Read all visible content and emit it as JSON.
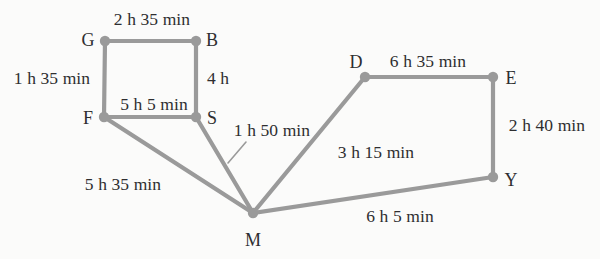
{
  "diagram": {
    "type": "undirected-weighted-graph",
    "title": "",
    "stroke_color": "#9a9a9a",
    "text_color": "#2e2e30",
    "background_color": "#fbfbfa",
    "nodes": [
      {
        "id": "G",
        "label": "G",
        "x": 105,
        "y": 41,
        "label_x": 88,
        "label_y": 40
      },
      {
        "id": "B",
        "label": "B",
        "x": 196,
        "y": 41,
        "label_x": 212,
        "label_y": 40
      },
      {
        "id": "F",
        "label": "F",
        "x": 104,
        "y": 117,
        "label_x": 88,
        "label_y": 118
      },
      {
        "id": "S",
        "label": "S",
        "x": 196,
        "y": 117,
        "label_x": 212,
        "label_y": 118
      },
      {
        "id": "M",
        "label": "M",
        "x": 253,
        "y": 213,
        "label_x": 253,
        "label_y": 240
      },
      {
        "id": "D",
        "label": "D",
        "x": 365,
        "y": 77,
        "label_x": 356,
        "label_y": 62
      },
      {
        "id": "E",
        "label": "E",
        "x": 493,
        "y": 77,
        "label_x": 511,
        "label_y": 78
      },
      {
        "id": "Y",
        "label": "Y",
        "x": 493,
        "y": 177,
        "label_x": 511,
        "label_y": 180
      }
    ],
    "edges": [
      {
        "id": "G-B",
        "from": "G",
        "to": "B",
        "weight": "2 h 35 min",
        "label_x": 152,
        "label_y": 20,
        "leader": null
      },
      {
        "id": "G-F",
        "from": "G",
        "to": "F",
        "weight": "1 h 35 min",
        "label_x": 52,
        "label_y": 79,
        "leader": null
      },
      {
        "id": "B-S",
        "from": "B",
        "to": "S",
        "weight": "4 h",
        "label_x": 218,
        "label_y": 79,
        "leader": null
      },
      {
        "id": "F-S",
        "from": "F",
        "to": "S",
        "weight": "5 h 5 min",
        "label_x": 154,
        "label_y": 105,
        "leader": null
      },
      {
        "id": "S-M",
        "from": "S",
        "to": "M",
        "weight": "1 h 50 min",
        "label_x": 272,
        "label_y": 131,
        "leader": {
          "x1": 228,
          "y1": 163,
          "x2": 246,
          "y2": 142
        }
      },
      {
        "id": "F-M",
        "from": "F",
        "to": "M",
        "weight": "5 h 35 min",
        "label_x": 123,
        "label_y": 185,
        "leader": null
      },
      {
        "id": "M-D",
        "from": "M",
        "to": "D",
        "weight": "3 h 15 min",
        "label_x": 376,
        "label_y": 153,
        "leader": null
      },
      {
        "id": "D-E",
        "from": "D",
        "to": "E",
        "weight": "6 h 35 min",
        "label_x": 428,
        "label_y": 62,
        "leader": null
      },
      {
        "id": "E-Y",
        "from": "E",
        "to": "Y",
        "weight": "2 h 40 min",
        "label_x": 547,
        "label_y": 126,
        "leader": null
      },
      {
        "id": "M-Y",
        "from": "M",
        "to": "Y",
        "weight": "6 h 5 min",
        "label_x": 400,
        "label_y": 217,
        "leader": null
      }
    ]
  }
}
